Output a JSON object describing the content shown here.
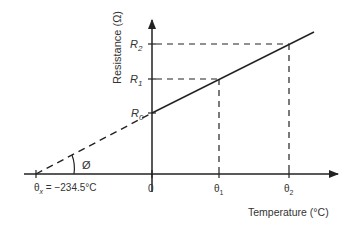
{
  "diagram": {
    "y_axis_label": "Resistance (Ω)",
    "x_axis_label": "Temperature (°C)",
    "origin_label": "0",
    "y_ticks": [
      {
        "main": "R",
        "sub": "2"
      },
      {
        "main": "R",
        "sub": "1"
      },
      {
        "main": "R",
        "sub": "0"
      }
    ],
    "x_ticks": [
      {
        "main": "θ",
        "sub": "1"
      },
      {
        "main": "θ",
        "sub": "2"
      }
    ],
    "intercept_label": {
      "main": "θ",
      "sub": "x",
      "value": " = −234.5°C"
    },
    "angle_label": "Ø",
    "colors": {
      "line": "#222222",
      "text": "#333333",
      "background": "#ffffff"
    }
  }
}
